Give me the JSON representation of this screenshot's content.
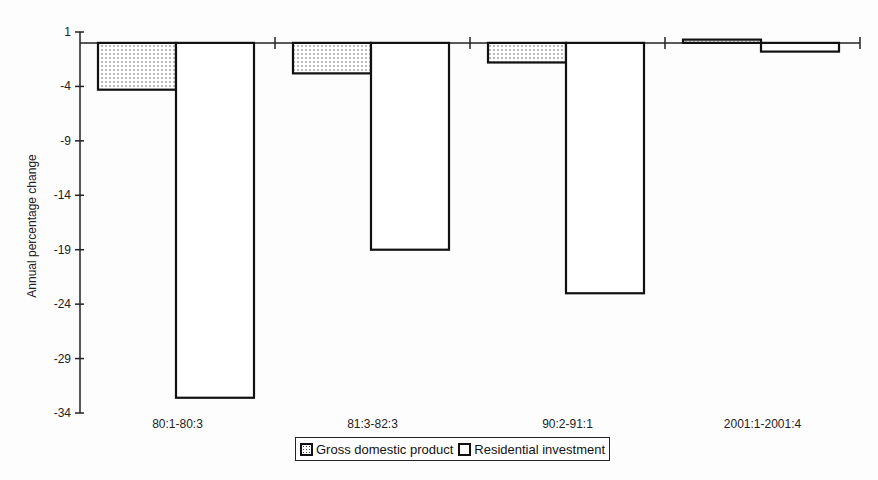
{
  "chart_data": {
    "type": "bar",
    "title": "",
    "xlabel": "",
    "ylabel": "Annual percentage change",
    "ylim": [
      -34,
      1
    ],
    "yticks": [
      1,
      -4,
      -9,
      -14,
      -19,
      -24,
      -29,
      -34
    ],
    "categories": [
      "80:1-80:3",
      "81:3-82:3",
      "90:2-91:1",
      "2001:1-2001:4"
    ],
    "series": [
      {
        "name": "Gross domestic product",
        "values": [
          -4.3,
          -2.8,
          -1.8,
          0.3
        ],
        "pattern": "dotted"
      },
      {
        "name": "Residential investment",
        "values": [
          -32.6,
          -19.0,
          -23.0,
          -0.8
        ],
        "pattern": "white"
      }
    ],
    "grid": false,
    "legend_position": "bottom"
  },
  "legend": {
    "items": [
      {
        "label": "Gross domestic product"
      },
      {
        "label": "Residential investment"
      }
    ]
  },
  "colors": {
    "bar_outline": "#111111",
    "bar_fill": "#ffffff",
    "dot_pattern": "#444444"
  }
}
